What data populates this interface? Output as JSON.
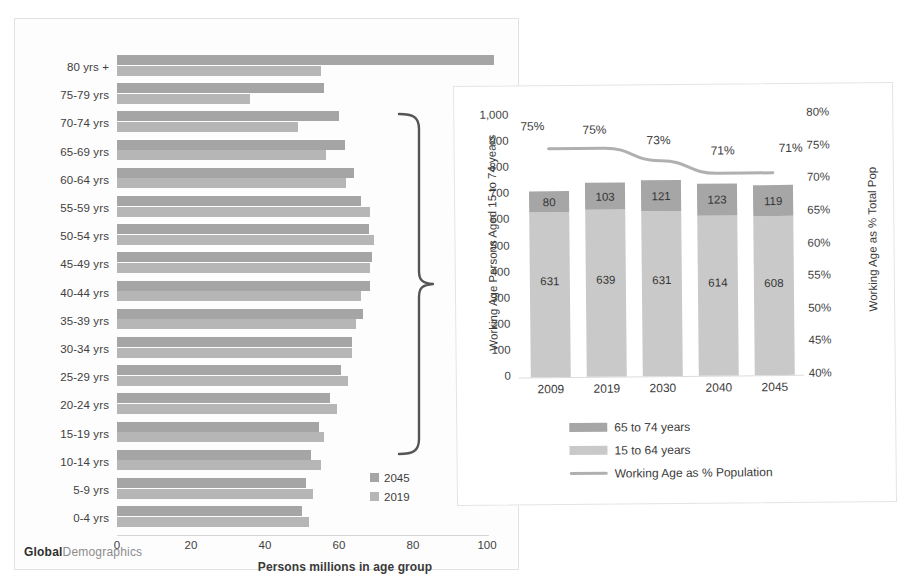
{
  "brand": {
    "bold": "Global",
    "light": "Demographics"
  },
  "left_chart": {
    "x_axis_title": "Persons millions in age group",
    "x_ticks": [
      "0",
      "20",
      "40",
      "60",
      "80",
      "100"
    ],
    "legend": [
      {
        "label": "2045",
        "color": "#a5a5a5"
      },
      {
        "label": "2019",
        "color": "#b6b6b6"
      }
    ]
  },
  "right_chart": {
    "y_title_left": "Working Age Persons Aged 15 to 74 years",
    "y_title_right": "Working Age as % Total Pop",
    "y_ticks_left": [
      "1,000",
      "900",
      "800",
      "700",
      "600",
      "500",
      "400",
      "300",
      "200",
      "100",
      "0"
    ],
    "y_ticks_right": [
      "80%",
      "75%",
      "70%",
      "65%",
      "60%",
      "55%",
      "50%",
      "45%",
      "40%"
    ],
    "legend": [
      {
        "label": "65 to 74 years",
        "color": "#a6a6a6",
        "kind": "swatch"
      },
      {
        "label": "15 to 64 years",
        "color": "#c9c9c9",
        "kind": "swatch"
      },
      {
        "label": "Working Age as % Population",
        "color": "#b0b0b0",
        "kind": "line"
      }
    ]
  },
  "chart_data": [
    {
      "type": "bar",
      "orientation": "horizontal",
      "title": "",
      "xlabel": "Persons millions in age group",
      "ylabel": "",
      "xlim": [
        0,
        100
      ],
      "grid": false,
      "legend_position": "inside-bottom-right",
      "categories": [
        "80 yrs +",
        "75-79 yrs",
        "70-74 yrs",
        "65-69 yrs",
        "60-64 yrs",
        "55-59 yrs",
        "50-54 yrs",
        "45-49 yrs",
        "40-44 yrs",
        "35-39 yrs",
        "30-34 yrs",
        "25-29 yrs",
        "20-24 yrs",
        "15-19 yrs",
        "10-14 yrs",
        "5-9 yrs",
        "0-4 yrs"
      ],
      "series": [
        {
          "name": "2045",
          "color": "#a5a5a5",
          "values": [
            102,
            56,
            60,
            61.5,
            64,
            66,
            68,
            69,
            68.5,
            66.5,
            63.5,
            60.5,
            57.5,
            54.5,
            52.5,
            51,
            50
          ]
        },
        {
          "name": "2019",
          "color": "#b6b6b6",
          "values": [
            55,
            36,
            49,
            56.5,
            62,
            68.5,
            69.5,
            68.5,
            66,
            64.5,
            63.5,
            62.5,
            59.5,
            56,
            55,
            53,
            52
          ]
        }
      ],
      "annotation": {
        "brace_label": "",
        "brace_covers": "10-14 yrs through 70-74 yrs"
      }
    },
    {
      "type": "bar",
      "stacked": true,
      "title": "",
      "xlabel": "",
      "ylabel": "Working Age Persons Aged 15 to 74 years",
      "ylabel_secondary": "Working Age as % Total Pop",
      "ylim": [
        0,
        1000
      ],
      "ylim_secondary": [
        0.4,
        0.8
      ],
      "grid": false,
      "legend_position": "bottom-left",
      "categories": [
        "2009",
        "2019",
        "2030",
        "2040",
        "2045"
      ],
      "series": [
        {
          "name": "15 to 64 years",
          "color": "#c9c9c9",
          "values": [
            631,
            639,
            631,
            614,
            608
          ],
          "axis": "left"
        },
        {
          "name": "65 to 74 years",
          "color": "#a6a6a6",
          "values": [
            80,
            103,
            121,
            123,
            119
          ],
          "axis": "left"
        },
        {
          "name": "Working Age as % Population",
          "color": "#b0b0b0",
          "type": "line",
          "values": [
            0.75,
            0.75,
            0.73,
            0.71,
            0.71
          ],
          "labels": [
            "75%",
            "75%",
            "73%",
            "71%",
            "71%"
          ],
          "axis": "right"
        }
      ]
    }
  ]
}
